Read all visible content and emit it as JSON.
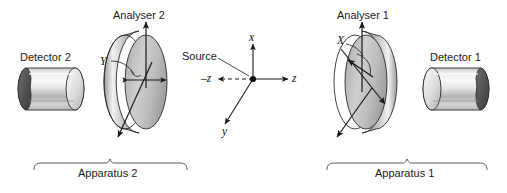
{
  "figure": {
    "type": "physics-apparatus-diagram",
    "width": 507,
    "height": 193,
    "background_color": "#ffffff",
    "line_color": "#1a1a1a"
  },
  "labels": {
    "detector_2": "Detector 2",
    "analyser_2": "Analyser 2",
    "source": "Source",
    "analyser_1": "Analyser 1",
    "detector_1": "Detector 1",
    "apparatus_2": "Apparatus 2",
    "apparatus_1": "Apparatus 1",
    "axis_x": "x",
    "axis_y": "y",
    "axis_z_positive": "z",
    "axis_z_negative": "–z",
    "analyser_2_orientation": "Y",
    "analyser_1_orientation": "X"
  },
  "components": [
    {
      "name": "detector-2",
      "label": "Detector 2",
      "shape": "cylinder",
      "aperture_side": "left",
      "aperture_color": "#4a4a4a",
      "body_fill": "#d9d9d9",
      "side": "apparatus-2"
    },
    {
      "name": "analyser-2",
      "label": "Analyser 2",
      "shape": "disc",
      "orientation_label": "Y",
      "body_fill": "#bdbdbd",
      "side": "apparatus-2"
    },
    {
      "name": "source",
      "label": "Source",
      "shape": "point",
      "color": "#111111",
      "side": "center"
    },
    {
      "name": "analyser-1",
      "label": "Analyser 1",
      "shape": "disc",
      "orientation_label": "X",
      "body_fill": "#bdbdbd",
      "side": "apparatus-1"
    },
    {
      "name": "detector-1",
      "label": "Detector 1",
      "shape": "cylinder",
      "aperture_side": "right",
      "aperture_color": "#4a4a4a",
      "body_fill": "#d9d9d9",
      "side": "apparatus-1"
    }
  ],
  "axes": {
    "origin_label": "Source",
    "ticks": [
      "x",
      "y",
      "z",
      "–z"
    ],
    "z_negative_style": "dashed",
    "z_positive_style": "solid",
    "x_direction": "up",
    "y_direction": "down-left",
    "z_direction": "right"
  },
  "brackets": [
    {
      "name": "apparatus-2-bracket",
      "label": "Apparatus 2",
      "from_x": 34,
      "to_x": 187
    },
    {
      "name": "apparatus-1-bracket",
      "label": "Apparatus 1",
      "from_x": 327,
      "to_x": 487
    }
  ]
}
